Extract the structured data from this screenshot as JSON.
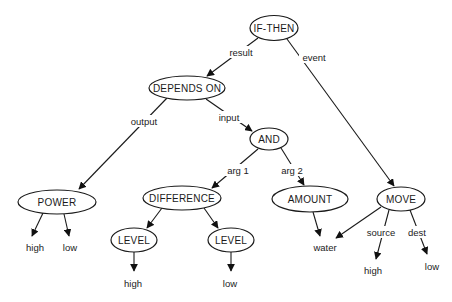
{
  "diagram": {
    "title": "",
    "nodes": [
      {
        "id": "if_then",
        "label": "IF-THEN",
        "cx": 274,
        "cy": 28,
        "rx": 24,
        "ry": 12.5
      },
      {
        "id": "depends_on",
        "label": "DEPENDS ON",
        "cx": 187,
        "cy": 88,
        "rx": 38,
        "ry": 12
      },
      {
        "id": "and",
        "label": "AND",
        "cx": 269,
        "cy": 139,
        "rx": 19,
        "ry": 11
      },
      {
        "id": "power",
        "label": "POWER",
        "cx": 57,
        "cy": 202,
        "rx": 39,
        "ry": 12
      },
      {
        "id": "difference",
        "label": "DIFFERENCE",
        "cx": 182,
        "cy": 198,
        "rx": 39,
        "ry": 12
      },
      {
        "id": "amount",
        "label": "AMOUNT",
        "cx": 310,
        "cy": 199,
        "rx": 38,
        "ry": 13
      },
      {
        "id": "move",
        "label": "MOVE",
        "cx": 401,
        "cy": 199,
        "rx": 24,
        "ry": 12
      },
      {
        "id": "level_1",
        "label": "LEVEL",
        "cx": 134,
        "cy": 240,
        "rx": 23,
        "ry": 12
      },
      {
        "id": "level_2",
        "label": "LEVEL",
        "cx": 231,
        "cy": 240,
        "rx": 23,
        "ry": 12
      }
    ],
    "leaves": [
      {
        "id": "power_high",
        "label": "high",
        "x": 35,
        "y": 247
      },
      {
        "id": "power_low",
        "label": "low",
        "x": 70,
        "y": 247
      },
      {
        "id": "level1_high",
        "label": "high",
        "x": 133,
        "y": 283
      },
      {
        "id": "level2_low",
        "label": "low",
        "x": 230,
        "y": 283
      },
      {
        "id": "water",
        "label": "water",
        "x": 325,
        "y": 247
      },
      {
        "id": "move_high",
        "label": "high",
        "x": 373,
        "y": 270
      },
      {
        "id": "move_low",
        "label": "low",
        "x": 432,
        "y": 266
      }
    ],
    "edges": [
      {
        "from": "if_then",
        "to": "depends_on",
        "label": "result",
        "x1": 258,
        "y1": 38,
        "x2": 207,
        "y2": 76,
        "lx": 241,
        "ly": 52
      },
      {
        "from": "if_then",
        "to": "move",
        "label": "event",
        "x1": 287,
        "y1": 39,
        "x2": 394,
        "y2": 186,
        "lx": 314,
        "ly": 57
      },
      {
        "from": "depends_on",
        "to": "power",
        "label": "output",
        "x1": 167,
        "y1": 98,
        "x2": 79,
        "y2": 189,
        "lx": 144,
        "ly": 121
      },
      {
        "from": "depends_on",
        "to": "and",
        "label": "input",
        "x1": 206,
        "y1": 99,
        "x2": 252,
        "y2": 131,
        "lx": 229,
        "ly": 117
      },
      {
        "from": "and",
        "to": "difference",
        "label": "arg 1",
        "x1": 258,
        "y1": 149,
        "x2": 212,
        "y2": 188,
        "lx": 238,
        "ly": 170
      },
      {
        "from": "and",
        "to": "amount",
        "label": "arg 2",
        "x1": 281,
        "y1": 148,
        "x2": 304,
        "y2": 185,
        "lx": 292,
        "ly": 170
      },
      {
        "from": "power",
        "to": "power_high",
        "label": "",
        "x1": 43,
        "y1": 213,
        "x2": 32,
        "y2": 236,
        "lx": 0,
        "ly": 0
      },
      {
        "from": "power",
        "to": "power_low",
        "label": "",
        "x1": 64,
        "y1": 214,
        "x2": 69,
        "y2": 236,
        "lx": 0,
        "ly": 0
      },
      {
        "from": "difference",
        "to": "level_1",
        "label": "",
        "x1": 162,
        "y1": 208,
        "x2": 147,
        "y2": 228,
        "lx": 0,
        "ly": 0
      },
      {
        "from": "difference",
        "to": "level_2",
        "label": "",
        "x1": 204,
        "y1": 208,
        "x2": 218,
        "y2": 228,
        "lx": 0,
        "ly": 0
      },
      {
        "from": "level_1",
        "to": "level1_high",
        "label": "",
        "x1": 134,
        "y1": 252,
        "x2": 134,
        "y2": 271,
        "lx": 0,
        "ly": 0
      },
      {
        "from": "level_2",
        "to": "level2_low",
        "label": "",
        "x1": 231,
        "y1": 252,
        "x2": 231,
        "y2": 271,
        "lx": 0,
        "ly": 0
      },
      {
        "from": "amount",
        "to": "water",
        "label": "",
        "x1": 313,
        "y1": 212,
        "x2": 320,
        "y2": 236,
        "lx": 0,
        "ly": 0
      },
      {
        "from": "move",
        "to": "water",
        "label": "",
        "x1": 381,
        "y1": 207,
        "x2": 336,
        "y2": 238,
        "lx": 0,
        "ly": 0
      },
      {
        "from": "move",
        "to": "move_high",
        "label": "source",
        "x1": 389,
        "y1": 210,
        "x2": 376,
        "y2": 259,
        "lx": 381,
        "ly": 232
      },
      {
        "from": "move",
        "to": "move_low",
        "label": "dest",
        "x1": 410,
        "y1": 210,
        "x2": 427,
        "y2": 254,
        "lx": 417,
        "ly": 232
      }
    ]
  }
}
